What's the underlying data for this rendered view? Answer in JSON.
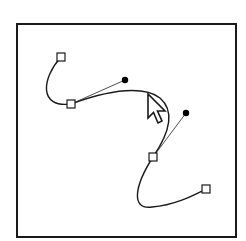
{
  "diagram": {
    "colors": {
      "background": "#ffffff",
      "frame": "#1a1a1a",
      "path": "#1a1a1a",
      "handle_line": "#3a3a3a",
      "anchor_fill": "#ffffff",
      "anchor_stroke": "#1a1a1a",
      "handle_dot": "#000000",
      "cursor_fill": "#ffffff",
      "cursor_stroke": "#1a1a1a"
    },
    "frame": {
      "x": 17,
      "y": 24,
      "width": 219,
      "height": 213
    },
    "anchors": [
      {
        "id": "anchor-1",
        "x": 61,
        "y": 57
      },
      {
        "id": "anchor-2",
        "x": 71,
        "y": 104
      },
      {
        "id": "anchor-3",
        "x": 153,
        "y": 157
      },
      {
        "id": "anchor-4",
        "x": 206,
        "y": 189
      }
    ],
    "handles": [
      {
        "id": "handle-1",
        "from_anchor": "anchor-2",
        "x": 125,
        "y": 80
      },
      {
        "id": "handle-2",
        "from_anchor": "anchor-3",
        "x": 186,
        "y": 113
      }
    ],
    "path_segments": [
      "M 61 57 C 42 78 38 108 71 104",
      "M 71 104 C 125 84 150 90 160 98 C 176 112 168 135 153 157",
      "M 153 157 C 135 185 130 210 152 207 C 175 205 192 196 206 189"
    ],
    "cursor": {
      "type": "arrow-pointer",
      "tip_x": 148,
      "tip_y": 94
    }
  }
}
